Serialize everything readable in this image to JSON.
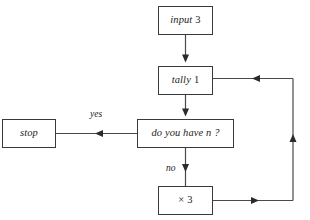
{
  "diagram": {
    "background_color": "#ffffff",
    "line_color": "#4a4a4a",
    "border_color": "#3a3a3a",
    "text_color": "#1d1d1d",
    "nodes": [
      {
        "id": "input",
        "label": "input",
        "value": "3",
        "shape": "rectangle"
      },
      {
        "id": "tally",
        "label": "tally",
        "value": "1",
        "shape": "rectangle"
      },
      {
        "id": "decision",
        "label": "do you have n ?",
        "value": "",
        "shape": "rectangle"
      },
      {
        "id": "stop",
        "label": "stop",
        "value": "",
        "shape": "rectangle"
      },
      {
        "id": "times",
        "label": "×",
        "value": "3",
        "shape": "rectangle"
      }
    ],
    "edge_labels": {
      "yes": "yes",
      "no": "no"
    },
    "edges": [
      {
        "from": "input",
        "to": "tally",
        "label": "",
        "direction": "down"
      },
      {
        "from": "tally",
        "to": "decision",
        "label": "",
        "direction": "down"
      },
      {
        "from": "decision",
        "to": "stop",
        "label": "yes",
        "direction": "left"
      },
      {
        "from": "decision",
        "to": "times",
        "label": "no",
        "direction": "down"
      },
      {
        "from": "times",
        "to": "tally",
        "label": "",
        "direction": "loop-right-up-left"
      }
    ]
  }
}
